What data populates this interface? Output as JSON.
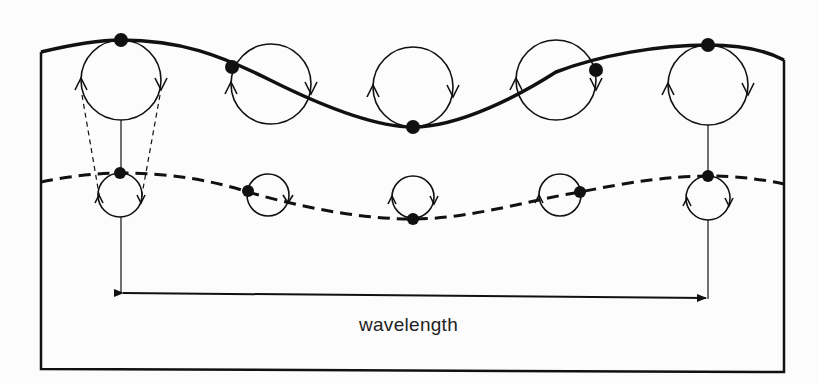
{
  "diagram": {
    "label": "wavelength",
    "colors": {
      "ink": "#111111",
      "background": "#fcfcfc"
    },
    "surface_wave": {
      "style": "solid",
      "peaks_x": [
        121,
        708
      ],
      "trough_x": 413
    },
    "subsurface_wave": {
      "style": "dashed"
    },
    "large_orbits": [
      {
        "cx": 121,
        "cy": 80,
        "r": 40
      },
      {
        "cx": 271,
        "cy": 84,
        "r": 40
      },
      {
        "cx": 413,
        "cy": 87,
        "r": 40
      },
      {
        "cx": 556,
        "cy": 80,
        "r": 40
      },
      {
        "cx": 708,
        "cy": 85,
        "r": 40
      }
    ],
    "small_orbits": [
      {
        "cx": 120,
        "cy": 195,
        "r": 22
      },
      {
        "cx": 268,
        "cy": 195,
        "r": 21
      },
      {
        "cx": 413,
        "cy": 197,
        "r": 21
      },
      {
        "cx": 560,
        "cy": 195,
        "r": 21
      },
      {
        "cx": 708,
        "cy": 198,
        "r": 22
      }
    ]
  }
}
